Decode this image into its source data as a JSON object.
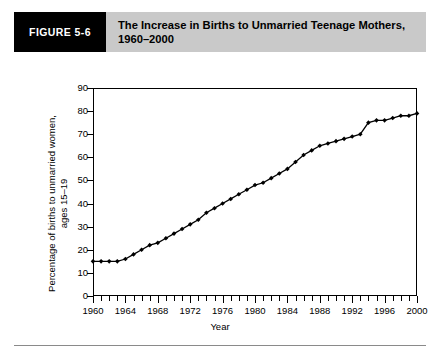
{
  "header": {
    "figure_tag": "FIGURE 5-6",
    "title_line1": "The Increase in Births to Unmarried Teenage Mothers,",
    "title_line2": "1960–2000",
    "tag_background": "#000000",
    "banner_background": "#c9c9c9"
  },
  "chart_data": {
    "type": "line",
    "title": "The Increase in Births to Unmarried Teenage Mothers, 1960–2000",
    "xlabel": "Year",
    "ylabel": "Percentage of births to unmarried women, ages 15–19",
    "xlim": [
      1960,
      2000
    ],
    "ylim": [
      0,
      90
    ],
    "ytick_labels": [
      "0",
      "10",
      "20",
      "30",
      "40",
      "50",
      "60",
      "70",
      "80",
      "90"
    ],
    "ytick_values": [
      0,
      10,
      20,
      30,
      40,
      50,
      60,
      70,
      80,
      90
    ],
    "xtick_labels": [
      "1960",
      "1964",
      "1968",
      "1972",
      "1976",
      "1980",
      "1984",
      "1988",
      "1992",
      "1996",
      "2000"
    ],
    "xtick_values": [
      1960,
      1964,
      1968,
      1972,
      1976,
      1980,
      1984,
      1988,
      1992,
      1996,
      2000
    ],
    "minor_xtick_interval": 1,
    "grid": false,
    "legend": null,
    "marker": "diamond",
    "line_color": "#000000",
    "x": [
      1960,
      1961,
      1962,
      1963,
      1964,
      1965,
      1966,
      1967,
      1968,
      1969,
      1970,
      1971,
      1972,
      1973,
      1974,
      1975,
      1976,
      1977,
      1978,
      1979,
      1980,
      1981,
      1982,
      1983,
      1984,
      1985,
      1986,
      1987,
      1988,
      1989,
      1990,
      1991,
      1992,
      1993,
      1994,
      1995,
      1996,
      1997,
      1998,
      1999,
      2000
    ],
    "values": [
      15,
      15,
      15,
      15,
      16,
      18,
      20,
      22,
      23,
      25,
      27,
      29,
      31,
      33,
      36,
      38,
      40,
      42,
      44,
      46,
      48,
      49,
      51,
      53,
      55,
      58,
      61,
      63,
      65,
      66,
      67,
      68,
      69,
      70,
      75,
      76,
      76,
      77,
      78,
      78,
      79
    ]
  },
  "axes": {
    "x_title": "Year",
    "y_title_line1": "Percentage of births to unmarried women,",
    "y_title_line2": "ages 15–19"
  }
}
